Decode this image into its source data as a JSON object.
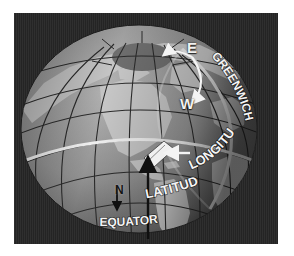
{
  "figure": {
    "background_color": "#262626",
    "border_color": "#ffffff"
  },
  "globe": {
    "ocean_color": "#8e8e8e",
    "land_color": "#c9c9c9",
    "shadow_color": "#4a4a4a",
    "graticule_color": "#2b2b2b",
    "highlight_color": "#f2f2f2",
    "polar_cap_color": "#6b6b6b"
  },
  "labels": {
    "equator": "EQUATOR",
    "latitude": "LATITUDE",
    "longitude": "LONGITUDE",
    "greenwich": "GREENWICH",
    "east": "E",
    "west": "W",
    "north": "N"
  },
  "markers": {
    "latitude_arrow": "black-up-arrow",
    "longitude_arrow": "white-left-arrow",
    "east_west_arrow": "white-curved-arrow",
    "north_arrow": "black-down-arrow"
  }
}
